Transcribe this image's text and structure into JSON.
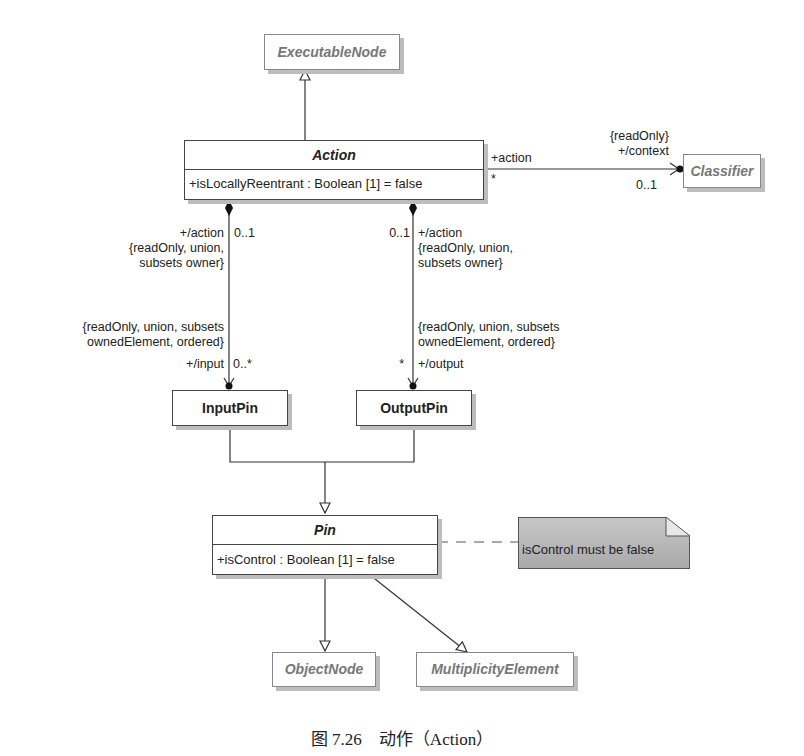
{
  "classes": {
    "executable_node": {
      "name": "ExecutableNode"
    },
    "action": {
      "name": "Action",
      "attribute": "+isLocallyReentrant : Boolean [1] = false"
    },
    "classifier": {
      "name": "Classifier"
    },
    "input_pin": {
      "name": "InputPin"
    },
    "output_pin": {
      "name": "OutputPin"
    },
    "pin": {
      "name": "Pin",
      "attribute": "+isControl : Boolean [1] = false"
    },
    "object_node": {
      "name": "ObjectNode"
    },
    "multiplicity_element": {
      "name": "MultiplicityElement"
    }
  },
  "associations": {
    "context": {
      "source_role": "+action",
      "source_mult": "*",
      "target_constraint": "{readOnly}",
      "target_role": "+/context",
      "target_mult": "0..1"
    },
    "input": {
      "owner_role": "+/action",
      "owner_mult": "0..1",
      "owner_constraint_1": "{readOnly, union,",
      "owner_constraint_2": "subsets owner}",
      "end_constraint_1": "{readOnly, union, subsets",
      "end_constraint_2": "ownedElement, ordered}",
      "end_role": "+/input",
      "end_mult": "0..*"
    },
    "output": {
      "owner_role": "+/action",
      "owner_mult": "0..1",
      "owner_constraint_1": "{readOnly, union,",
      "owner_constraint_2": "subsets owner}",
      "end_constraint_1": "{readOnly, union, subsets",
      "end_constraint_2": "ownedElement, ordered}",
      "end_role": "+/output",
      "end_mult": "*"
    }
  },
  "note": {
    "text": "isControl must be false"
  },
  "caption": "图 7.26　动作（Action）"
}
